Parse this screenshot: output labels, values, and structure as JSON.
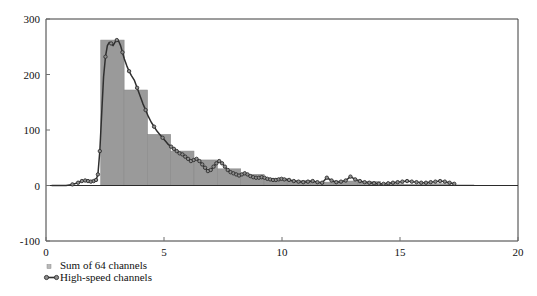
{
  "chart_data": {
    "type": "bar",
    "title": "",
    "subtitle": "",
    "xlabel": "",
    "ylabel": "",
    "xlim": [
      0,
      20
    ],
    "ylim": [
      -100,
      300
    ],
    "xticks": [
      0,
      5,
      10,
      15,
      20
    ],
    "xtick_labels": [
      "0",
      "5",
      "10",
      "15",
      "20"
    ],
    "yticks": [
      -100,
      0,
      100,
      200,
      300
    ],
    "ytick_labels": [
      "-100",
      "0",
      "100",
      "200",
      "300"
    ],
    "grid": false,
    "legend_position": "below-left",
    "legend": [
      {
        "label": "Sum of 64 channels",
        "marker": "small-square",
        "color": "#9a9a9a",
        "style": "histogram-bars"
      },
      {
        "label": "High-speed channels",
        "marker": "circle",
        "color": "#2f2f2f",
        "style": "line-with-markers"
      }
    ],
    "series": [
      {
        "name": "Sum of 64 channels",
        "plot_type": "bar",
        "bin_edges": [
          2.32,
          3.31,
          4.3,
          5.28,
          6.27,
          7.26,
          8.25,
          9.24,
          10.22,
          11.21,
          12.2,
          13.19,
          14.17,
          15.16,
          16.15,
          17.14,
          18.13
        ],
        "values": [
          262,
          172,
          92,
          62,
          46,
          30,
          20,
          13,
          9,
          6,
          8,
          7,
          3,
          2,
          3,
          1
        ]
      },
      {
        "name": "High-speed channels",
        "plot_type": "line",
        "x": [
          0.25,
          0.55,
          0.85,
          1.12,
          1.36,
          1.52,
          1.66,
          1.78,
          1.9,
          2.02,
          2.12,
          2.2,
          2.28,
          2.36,
          2.44,
          2.52,
          2.6,
          2.68,
          2.76,
          2.84,
          2.92,
          3.0,
          3.08,
          3.16,
          3.24,
          3.32,
          3.42,
          3.52,
          3.62,
          3.74,
          3.86,
          3.98,
          4.1,
          4.22,
          4.34,
          4.46,
          4.58,
          4.7,
          4.82,
          4.94,
          5.06,
          5.18,
          5.3,
          5.42,
          5.54,
          5.66,
          5.78,
          5.9,
          6.02,
          6.14,
          6.26,
          6.38,
          6.5,
          6.62,
          6.74,
          6.86,
          6.98,
          7.1,
          7.22,
          7.34,
          7.46,
          7.58,
          7.7,
          7.82,
          7.94,
          8.06,
          8.18,
          8.3,
          8.42,
          8.54,
          8.66,
          8.78,
          8.9,
          9.02,
          9.14,
          9.26,
          9.38,
          9.5,
          9.62,
          9.74,
          9.86,
          9.98,
          10.1,
          10.3,
          10.5,
          10.7,
          10.9,
          11.1,
          11.3,
          11.5,
          11.7,
          11.9,
          12.1,
          12.3,
          12.5,
          12.7,
          12.9,
          13.1,
          13.3,
          13.5,
          13.7,
          13.9,
          14.1,
          14.3,
          14.5,
          14.7,
          14.9,
          15.1,
          15.3,
          15.5,
          15.7,
          15.9,
          16.1,
          16.3,
          16.5,
          16.7,
          16.9,
          17.1,
          17.3
        ],
        "y": [
          0,
          0,
          0,
          2,
          5,
          8,
          9,
          8,
          7,
          8,
          10,
          20,
          62,
          130,
          196,
          232,
          252,
          258,
          256,
          252,
          258,
          262,
          260,
          252,
          240,
          228,
          216,
          206,
          198,
          190,
          176,
          162,
          148,
          136,
          124,
          114,
          106,
          98,
          92,
          86,
          80,
          74,
          70,
          66,
          62,
          58,
          56,
          52,
          48,
          44,
          46,
          48,
          44,
          38,
          32,
          26,
          28,
          34,
          40,
          44,
          40,
          34,
          28,
          24,
          22,
          20,
          18,
          20,
          22,
          20,
          17,
          15,
          14,
          14,
          15,
          14,
          12,
          11,
          10,
          10,
          11,
          12,
          11,
          10,
          8,
          7,
          6,
          7,
          8,
          6,
          5,
          14,
          9,
          6,
          7,
          9,
          16,
          11,
          8,
          6,
          5,
          4,
          3,
          3,
          4,
          5,
          6,
          7,
          8,
          7,
          6,
          5,
          5,
          6,
          7,
          8,
          7,
          5,
          3
        ]
      }
    ]
  },
  "legend_items": {
    "sum": "Sum of 64 channels",
    "highspeed": "High-speed channels"
  }
}
